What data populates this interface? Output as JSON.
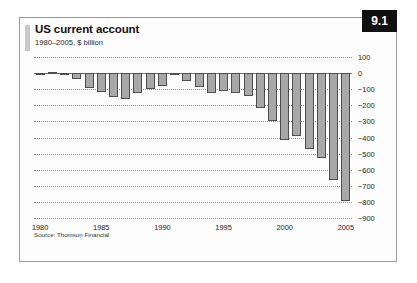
{
  "figure": {
    "title": "US current account",
    "subtitle": "1980–2005, $ billion",
    "badge": "9.1",
    "source": "Source: Thomson Financial"
  },
  "chart_data": {
    "type": "bar",
    "title": "US current account",
    "subtitle": "1980–2005, $ billion",
    "xlabel": "",
    "ylabel": "$ billion",
    "ylim": [
      -900,
      100
    ],
    "yticks": [
      100,
      0,
      -100,
      -200,
      -300,
      -400,
      -500,
      -600,
      -700,
      -800,
      -900
    ],
    "ytick_labels": [
      "100",
      "0",
      "−100",
      "−200",
      "−300",
      "−400",
      "−500",
      "−600",
      "−700",
      "−800",
      "−900"
    ],
    "xticks": [
      1980,
      1985,
      1990,
      1995,
      2000,
      2005
    ],
    "xtick_labels": [
      "1980",
      "1985",
      "1990",
      "1995",
      "2000",
      "2005"
    ],
    "grid": true,
    "legend": false,
    "bar_color": "#a8a8a8",
    "bar_edge_color": "#4e4e4e",
    "categories": [
      "1980",
      "1981",
      "1982",
      "1983",
      "1984",
      "1985",
      "1986",
      "1987",
      "1988",
      "1989",
      "1990",
      "1991",
      "1992",
      "1993",
      "1994",
      "1995",
      "1996",
      "1997",
      "1998",
      "1999",
      "2000",
      "2001",
      "2002",
      "2003",
      "2004",
      "2005"
    ],
    "values": [
      2,
      5,
      -5,
      -38,
      -94,
      -118,
      -147,
      -161,
      -121,
      -99,
      -79,
      3,
      -50,
      -85,
      -122,
      -114,
      -125,
      -141,
      -214,
      -300,
      -416,
      -389,
      -472,
      -528,
      -665,
      -792
    ],
    "series": [
      {
        "name": "US current account balance",
        "values": [
          2,
          5,
          -5,
          -38,
          -94,
          -118,
          -147,
          -161,
          -121,
          -99,
          -79,
          3,
          -50,
          -85,
          -122,
          -114,
          -125,
          -141,
          -214,
          -300,
          -416,
          -389,
          -472,
          -528,
          -665,
          -792
        ]
      }
    ]
  }
}
